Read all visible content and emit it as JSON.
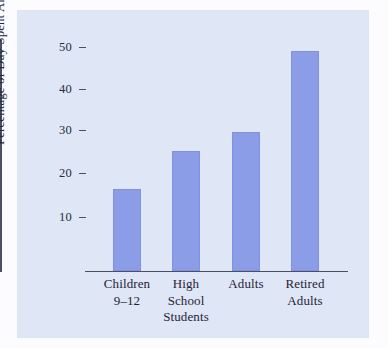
{
  "chart_data": {
    "type": "bar",
    "title": "",
    "xlabel": "",
    "ylabel": "Percentage of Day Spent Alone",
    "categories": [
      "Children 9–12",
      "High School Students",
      "Adults",
      "Retired Adults"
    ],
    "category_lines": [
      [
        "Children",
        "9–12"
      ],
      [
        "High",
        "School",
        "Students"
      ],
      [
        "Adults"
      ],
      [
        "Retired",
        "Adults"
      ]
    ],
    "values": [
      16.5,
      25.5,
      30,
      49
    ],
    "ylim": [
      0,
      52
    ],
    "yticks": [
      10,
      20,
      30,
      40,
      50
    ],
    "ytick_labels": [
      "10",
      "20",
      "30",
      "40",
      "50"
    ],
    "grid": false,
    "legend": null,
    "bar_color": "#8b9de6",
    "panel_color": "#dfe6f5",
    "axis_color": "#4a4f63",
    "text_color": "#1f2438"
  }
}
